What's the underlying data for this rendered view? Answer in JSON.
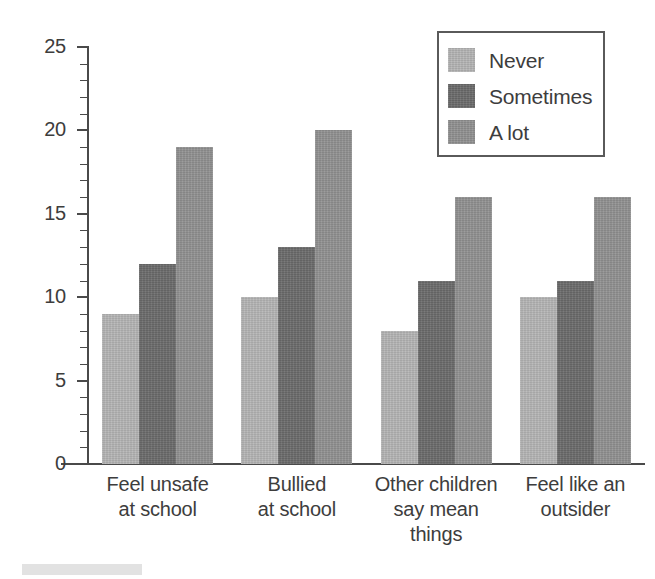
{
  "chart_data": {
    "type": "bar",
    "title": "",
    "subtitle": "",
    "xlabel": "",
    "ylabel": "",
    "ylim": [
      0,
      25
    ],
    "y_major_ticks": [
      0,
      5,
      10,
      15,
      20,
      25
    ],
    "y_tick_labels": [
      "0",
      "5",
      "10",
      "15",
      "20",
      "25"
    ],
    "y_minor_tick_interval": 1,
    "grid": false,
    "legend_position": "top-right",
    "categories": [
      "Feel unsafe at school",
      "Bullied at school",
      "Other children say mean things",
      "Feel like an outsider"
    ],
    "category_lines": [
      [
        "Feel unsafe",
        "at school"
      ],
      [
        "Bullied",
        "at school"
      ],
      [
        "Other children",
        "say mean",
        "things"
      ],
      [
        "Feel like an",
        "outsider"
      ]
    ],
    "series": [
      {
        "name": "Never",
        "color": "#b5b5b5",
        "values": [
          9,
          10,
          8,
          10
        ]
      },
      {
        "name": "Sometimes",
        "color": "#6b6b6b",
        "values": [
          12,
          13,
          11,
          11
        ]
      },
      {
        "name": "A lot",
        "color": "#919191",
        "values": [
          19,
          20,
          16,
          16
        ]
      }
    ]
  },
  "legend": {
    "items": [
      {
        "label": "Never",
        "swatch": "never"
      },
      {
        "label": "Sometimes",
        "swatch": "sometimes"
      },
      {
        "label": "A lot",
        "swatch": "alot"
      }
    ]
  },
  "colors": {
    "never": "#b5b5b5",
    "sometimes": "#6b6b6b",
    "alot": "#919191",
    "axis": "#4a4a4a",
    "text": "#3d3d3d",
    "background": "#ffffff"
  }
}
